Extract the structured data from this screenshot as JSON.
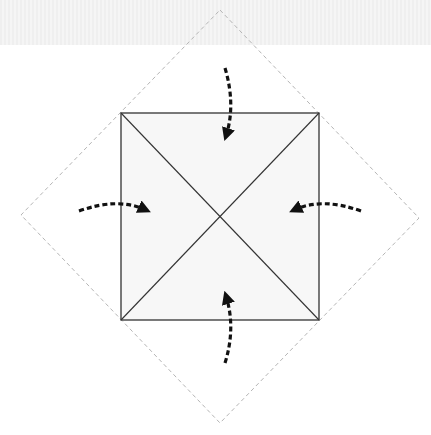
{
  "diagram": {
    "type": "origami-fold-instruction",
    "background_band_color": "#f0f0f0",
    "outer_diamond": {
      "style": "dashed",
      "color": "#b5b5b5",
      "vertices": [
        [
          220,
          10
        ],
        [
          419,
          218
        ],
        [
          220,
          423
        ],
        [
          21,
          215
        ]
      ]
    },
    "inner_square": {
      "fill": "#f7f7f7",
      "stroke": "#333333",
      "corners": [
        [
          121,
          113
        ],
        [
          319,
          113
        ],
        [
          319,
          320
        ],
        [
          121,
          320
        ]
      ],
      "center": [
        220,
        216
      ],
      "diagonals": true
    },
    "arrows": [
      {
        "name": "top",
        "direction": "fold-down-to-center"
      },
      {
        "name": "left",
        "direction": "fold-right-to-center"
      },
      {
        "name": "right",
        "direction": "fold-left-to-center"
      },
      {
        "name": "bottom",
        "direction": "fold-up-to-center"
      }
    ],
    "arrow_color": "#111111"
  }
}
